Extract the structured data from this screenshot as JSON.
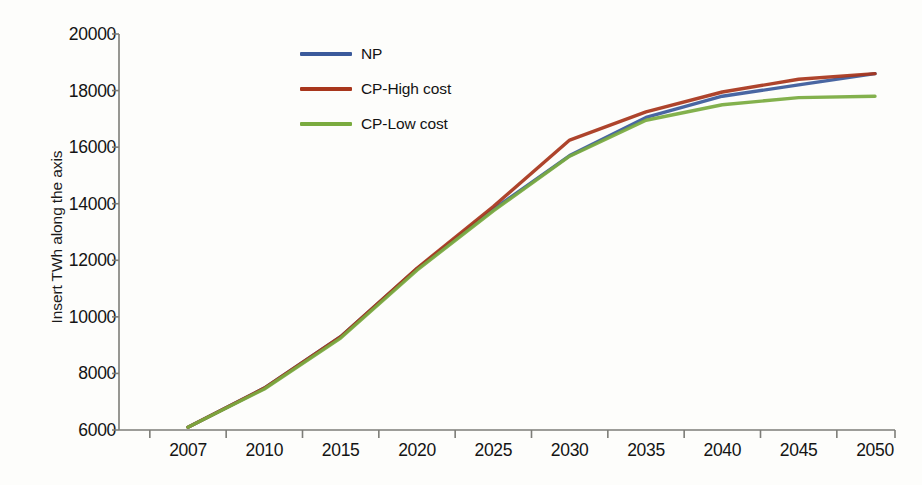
{
  "chart_data": {
    "type": "line",
    "title": "",
    "xlabel": "",
    "ylabel": "Insert TWh along the axis",
    "categories": [
      "2007",
      "2010",
      "2015",
      "2020",
      "2025",
      "2030",
      "2035",
      "2040",
      "2045",
      "2050"
    ],
    "ylim": [
      6000,
      20000
    ],
    "yticks": [
      6000,
      8000,
      10000,
      12000,
      14000,
      16000,
      18000,
      20000
    ],
    "ytick_labels": [
      "6000",
      "8000",
      "10000",
      "12000",
      "14000",
      "16000",
      "18000",
      "20000"
    ],
    "grid": false,
    "legend_position": "top-center",
    "series": [
      {
        "name": "NP",
        "color": "#3b5a9b",
        "values": [
          6100,
          7480,
          9300,
          11700,
          13800,
          15700,
          17050,
          17800,
          18200,
          18600
        ]
      },
      {
        "name": "CP-High cost",
        "color": "#a8361c",
        "values": [
          6100,
          7480,
          9300,
          11720,
          13900,
          16250,
          17250,
          17950,
          18400,
          18600
        ]
      },
      {
        "name": "CP-Low cost",
        "color": "#7aab3f",
        "values": [
          6100,
          7450,
          9250,
          11650,
          13750,
          15680,
          16950,
          17500,
          17750,
          17800
        ]
      }
    ]
  },
  "axes": {
    "y_title": "Insert TWh along the axis"
  },
  "legend": {
    "items": [
      {
        "label": "NP",
        "color": "#3b5a9b"
      },
      {
        "label": "CP-High cost",
        "color": "#a8361c"
      },
      {
        "label": "CP-Low cost",
        "color": "#7aab3f"
      }
    ]
  },
  "colors": {
    "background": "#fdfdfb",
    "axis": "#7d7d78",
    "text": "#141414"
  }
}
